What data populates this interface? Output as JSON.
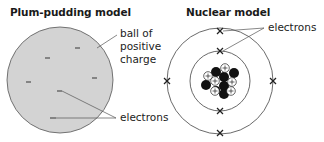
{
  "left_panel": {
    "title": "Plum-pudding model",
    "labels": {
      "ball_line1": "ball of",
      "ball_line2": "positive",
      "ball_line3": "charge",
      "electrons": "electrons"
    },
    "ball_color": "#d3d3d3",
    "electron_symbol": "–"
  },
  "right_panel": {
    "title": "Nuclear model",
    "labels": {
      "electrons": "electrons"
    },
    "proton_symbol": "+",
    "electron_symbol": "×",
    "neutron_color": "#111111"
  }
}
